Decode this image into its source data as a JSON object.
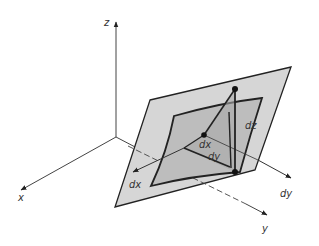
{
  "diagram": {
    "colors": {
      "background": "#ffffff",
      "plane_fill": "#d6d6d6",
      "surface_fill": "#bdbdbd",
      "triangle_fill": "#a9a9a9",
      "stroke": "#222222",
      "axis": "#444444"
    },
    "axes": {
      "z_label": "z",
      "x_label": "x",
      "y_label": "y"
    },
    "labels": {
      "dx_surface": "dx",
      "dy_surface": "dy",
      "dz": "dz",
      "dx_arrow": "dx",
      "dy_arrow": "dy"
    }
  }
}
